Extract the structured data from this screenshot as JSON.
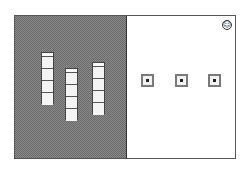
{
  "scene": {
    "left_panel": {
      "pattern": "dithered-gray",
      "columns": [
        {
          "id": 1,
          "cells": 4,
          "x": 27,
          "y": 37
        },
        {
          "id": 2,
          "cells": 4,
          "x": 51,
          "y": 53
        },
        {
          "id": 3,
          "cells": 4,
          "x": 78,
          "y": 47
        }
      ]
    },
    "right_panel": {
      "targets": [
        {
          "id": 1,
          "x": 127,
          "y": 59
        },
        {
          "id": 2,
          "x": 161,
          "y": 59
        },
        {
          "id": 3,
          "x": 194,
          "y": 59
        }
      ],
      "status_icon": {
        "name": "smiley-icon",
        "glyph": "☺"
      }
    }
  },
  "colors": {
    "frame_border": "#555555",
    "dither_light": "#8a8a8a",
    "dither_dark": "#6a6a6a",
    "target_ring": "#7a7a7a"
  }
}
